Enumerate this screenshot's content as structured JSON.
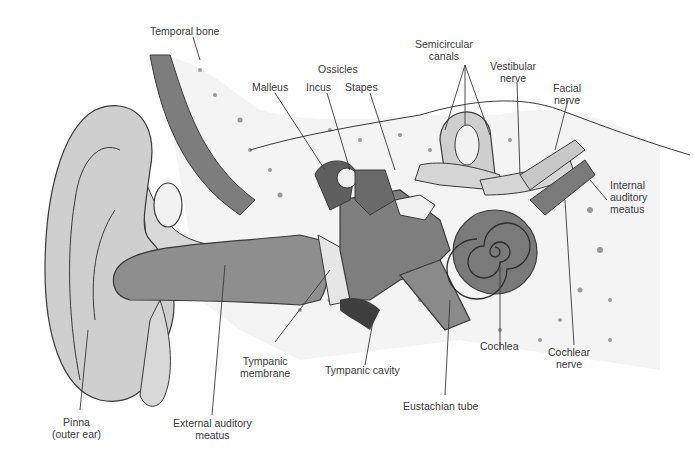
{
  "labels": {
    "temporal_bone": "Temporal bone",
    "ossicles": "Ossicles",
    "malleus": "Malleus",
    "incus": "Incus",
    "stapes": "Stapes",
    "semicircular_canals_1": "Semicircular",
    "semicircular_canals_2": "canals",
    "vestibular_nerve_1": "Vestibular",
    "vestibular_nerve_2": "nerve",
    "facial_nerve_1": "Facial",
    "facial_nerve_2": "nerve",
    "internal_auditory_meatus_1": "Internal",
    "internal_auditory_meatus_2": "auditory",
    "internal_auditory_meatus_3": "meatus",
    "cochlea": "Cochlea",
    "cochlear_nerve_1": "Cochlear",
    "cochlear_nerve_2": "nerve",
    "eustachian_tube": "Eustachian tube",
    "tympanic_cavity": "Tympanic cavity",
    "tympanic_membrane_1": "Tympanic",
    "tympanic_membrane_2": "membrane",
    "external_auditory_meatus_1": "External auditory",
    "external_auditory_meatus_2": "meatus",
    "pinna_1": "Pinna",
    "pinna_2": "(outer ear)"
  },
  "colors": {
    "outline": "#3a3a3a",
    "skin": "#cfcfcf",
    "canal": "#8e8e8e",
    "bone": "#f2f2f2",
    "dark": "#6a6a6a"
  }
}
